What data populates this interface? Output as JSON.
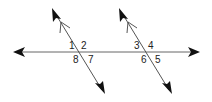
{
  "diagram": {
    "colors": {
      "line": "#555555",
      "arrow": "#111111",
      "label": "#222222",
      "background": "#ffffff"
    },
    "angle_labels": {
      "a1": "1",
      "a2": "2",
      "a3": "3",
      "a4": "4",
      "a5": "5",
      "a6": "6",
      "a7": "7",
      "a8": "8"
    }
  }
}
